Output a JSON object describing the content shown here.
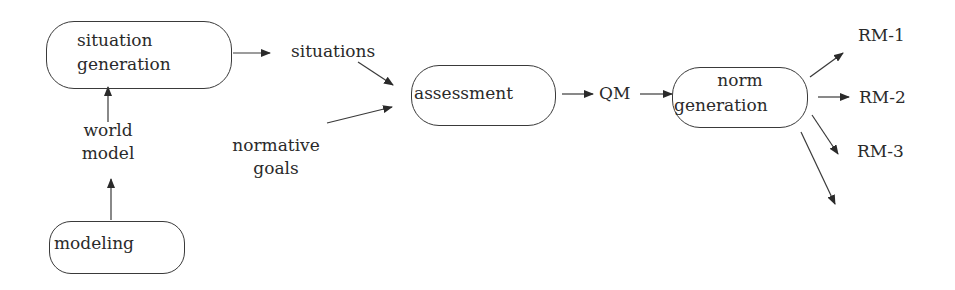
{
  "diagram": {
    "type": "flowchart",
    "nodes": {
      "situation_generation": {
        "line1": "situation",
        "line2": "generation"
      },
      "modeling": {
        "label": "modeling"
      },
      "assessment": {
        "label": "assessment"
      },
      "norm_generation": {
        "line1": "norm",
        "line2": "generation"
      }
    },
    "labels": {
      "situations": "situations",
      "world_model_line1": "world",
      "world_model_line2": "model",
      "normative_goals_line1": "normative",
      "normative_goals_line2": "goals",
      "qm": "QM",
      "rm1": "RM-1",
      "rm2": "RM-2",
      "rm3": "RM-3"
    },
    "edges": [
      {
        "from": "modeling",
        "to": "world model"
      },
      {
        "from": "world model",
        "to": "situation generation"
      },
      {
        "from": "situation generation",
        "to": "situations"
      },
      {
        "from": "situations",
        "to": "assessment"
      },
      {
        "from": "normative goals",
        "to": "assessment"
      },
      {
        "from": "assessment",
        "to": "QM"
      },
      {
        "from": "QM",
        "to": "norm generation"
      },
      {
        "from": "norm generation",
        "to": "RM-1"
      },
      {
        "from": "norm generation",
        "to": "RM-2"
      },
      {
        "from": "norm generation",
        "to": "RM-3"
      },
      {
        "from": "norm generation",
        "to": "(unlabeled)"
      }
    ],
    "colors": {
      "line": "#3a3a3a",
      "text": "#2a2a2a",
      "background": "#ffffff"
    }
  }
}
